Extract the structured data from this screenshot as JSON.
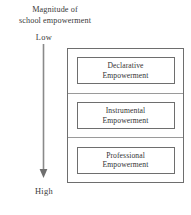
{
  "diagram": {
    "axis": {
      "caption_line1": "Magnitude of",
      "caption_line2": "school empowerment",
      "low_label": "Low",
      "high_label": "High",
      "direction": "downward",
      "arrow_color": "#8a8a8a"
    },
    "levels": [
      {
        "line1": "Declarative",
        "line2": "Empowerment"
      },
      {
        "line1": "Instrumental",
        "line2": "Empowerment"
      },
      {
        "line1": "Professional",
        "line2": "Empowerment"
      }
    ],
    "colors": {
      "background": "#ffffff",
      "outer_border": "#6e6e6e",
      "inner_border": "#6e6e6e",
      "divider": "#9a9a9a",
      "text": "#333333"
    }
  }
}
